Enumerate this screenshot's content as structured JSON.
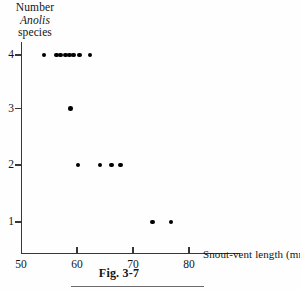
{
  "caption": "Fig. 3-7",
  "chart_data": {
    "type": "scatter",
    "title": "",
    "xlabel": "Snout-vent length (mm)",
    "ylabel_lines": [
      "Number",
      "Anolis",
      "species"
    ],
    "ylabel_italic_line": "Anolis",
    "xlim": [
      50,
      81
    ],
    "ylim": [
      0.55,
      4.45
    ],
    "xticks": [
      50,
      60,
      70,
      80
    ],
    "yticks": [
      1,
      2,
      3,
      4
    ],
    "xtick_labels": [
      "50",
      "60",
      "70",
      "80"
    ],
    "ytick_labels": [
      "1",
      "2",
      "3",
      "4"
    ],
    "grid": false,
    "legend": false,
    "marker": "filled-circle",
    "marker_color": "#000000",
    "points": [
      {
        "x": 54.1,
        "y": 4
      },
      {
        "x": 56.3,
        "y": 4
      },
      {
        "x": 57.1,
        "y": 4
      },
      {
        "x": 57.9,
        "y": 4
      },
      {
        "x": 58.7,
        "y": 4
      },
      {
        "x": 59.4,
        "y": 4
      },
      {
        "x": 60.4,
        "y": 4
      },
      {
        "x": 62.3,
        "y": 4
      },
      {
        "x": 58.8,
        "y": 3
      },
      {
        "x": 60.2,
        "y": 2
      },
      {
        "x": 64.1,
        "y": 2
      },
      {
        "x": 66.2,
        "y": 2
      },
      {
        "x": 67.8,
        "y": 2
      },
      {
        "x": 73.5,
        "y": 1
      },
      {
        "x": 76.8,
        "y": 1
      }
    ]
  }
}
